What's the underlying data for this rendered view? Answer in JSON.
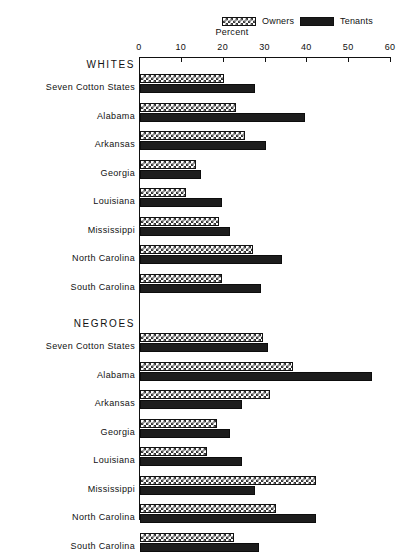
{
  "legend": {
    "entries": [
      {
        "label": "Owners",
        "icon": "checkered-swatch",
        "color": "#333333"
      },
      {
        "label": "Tenants",
        "icon": "solid-swatch",
        "color": "#1d1d1d"
      }
    ]
  },
  "axis": {
    "title": "Percent",
    "ticks": [
      "0",
      "10",
      "20",
      "30",
      "40",
      "50",
      "60"
    ]
  },
  "sections": [
    {
      "heading": "WHITES"
    },
    {
      "heading": "NEGROES"
    }
  ],
  "chart_data": {
    "type": "bar",
    "orientation": "horizontal",
    "title": "",
    "xlabel": "Percent",
    "ylabel": "",
    "xlim": [
      0,
      60
    ],
    "grid": false,
    "legend_position": "top",
    "tick_values": [
      0,
      10,
      20,
      30,
      40,
      50,
      60
    ],
    "series": [
      {
        "name": "Owners",
        "pattern": "checkered"
      },
      {
        "name": "Tenants",
        "pattern": "solid"
      }
    ],
    "groups": [
      {
        "group": "WHITES",
        "categories": [
          "Seven Cotton States",
          "Alabama",
          "Arkansas",
          "Georgia",
          "Louisiana",
          "Mississippi",
          "North Carolina",
          "South Carolina"
        ],
        "Owners": [
          20.0,
          23.0,
          25.0,
          13.5,
          11.0,
          19.0,
          27.0,
          19.5
        ],
        "Tenants": [
          27.5,
          39.5,
          30.0,
          14.5,
          19.5,
          21.5,
          34.0,
          29.0
        ]
      },
      {
        "group": "NEGROES",
        "categories": [
          "Seven Cotton States",
          "Alabama",
          "Arkansas",
          "Georgia",
          "Louisiana",
          "Mississippi",
          "North Carolina",
          "South Carolina"
        ],
        "Owners": [
          29.5,
          36.5,
          31.0,
          18.5,
          16.0,
          42.0,
          32.5,
          22.5
        ],
        "Tenants": [
          30.5,
          55.5,
          24.5,
          21.5,
          24.5,
          27.5,
          42.0,
          28.5
        ]
      }
    ]
  }
}
